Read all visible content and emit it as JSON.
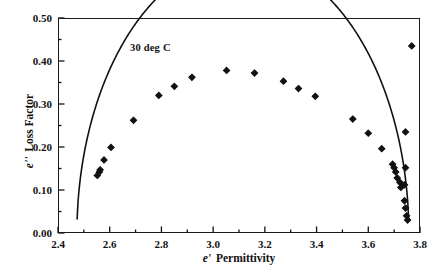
{
  "chart_data": {
    "type": "scatter",
    "title": "",
    "xlabel": "e' Permittivity",
    "ylabel": "e'' Loss Factor",
    "xlabel_symbol": "e",
    "xlabel_prime": "'",
    "xlabel_text": "Permittivity",
    "ylabel_symbol": "e",
    "ylabel_prime": "''",
    "ylabel_text": "Loss Factor",
    "annotation": "30 deg C",
    "xlim": [
      2.4,
      3.8
    ],
    "ylim": [
      0.0,
      0.5
    ],
    "grid": false,
    "legend": false,
    "xticks": [
      2.4,
      2.6,
      2.8,
      3.0,
      3.2,
      3.4,
      3.6,
      3.8
    ],
    "xtick_labels": [
      "2.4",
      "2.6",
      "2.8",
      "3.0",
      "3.2",
      "3.4",
      "3.6",
      "3.8"
    ],
    "xminor_step": 0.1,
    "yticks": [
      0.0,
      0.1,
      0.2,
      0.3,
      0.4,
      0.5
    ],
    "ytick_labels": [
      "0.00",
      "0.10",
      "0.20",
      "0.30",
      "0.40",
      "0.50"
    ],
    "yminor_step": 0.05,
    "marker": "diamond",
    "marker_color": "#111111",
    "line_color": "#111111",
    "series": [
      {
        "name": "measured",
        "points": [
          [
            2.552,
            0.134
          ],
          [
            2.56,
            0.142
          ],
          [
            2.563,
            0.147
          ],
          [
            2.578,
            0.17
          ],
          [
            2.605,
            0.199
          ],
          [
            2.692,
            0.262
          ],
          [
            2.79,
            0.32
          ],
          [
            2.85,
            0.341
          ],
          [
            2.918,
            0.362
          ],
          [
            3.052,
            0.378
          ],
          [
            3.16,
            0.372
          ],
          [
            3.272,
            0.353
          ],
          [
            3.33,
            0.336
          ],
          [
            3.395,
            0.318
          ],
          [
            3.54,
            0.265
          ],
          [
            3.6,
            0.232
          ],
          [
            3.652,
            0.196
          ],
          [
            3.694,
            0.16
          ],
          [
            3.7,
            0.152
          ],
          [
            3.706,
            0.142
          ],
          [
            3.712,
            0.128
          ],
          [
            3.722,
            0.118
          ],
          [
            3.726,
            0.106
          ],
          [
            3.74,
            0.075
          ],
          [
            3.744,
            0.058
          ],
          [
            3.748,
            0.04
          ],
          [
            3.752,
            0.03
          ],
          [
            3.744,
            0.152
          ],
          [
            3.74,
            0.112
          ],
          [
            3.744,
            0.235
          ],
          [
            3.768,
            0.435
          ]
        ]
      }
    ],
    "fit_curve": {
      "name": "Cole-Cole arc",
      "center_x": 3.115,
      "center_y": -0.003,
      "radius": 0.642,
      "x_start": 2.474,
      "x_end": 3.756
    }
  }
}
